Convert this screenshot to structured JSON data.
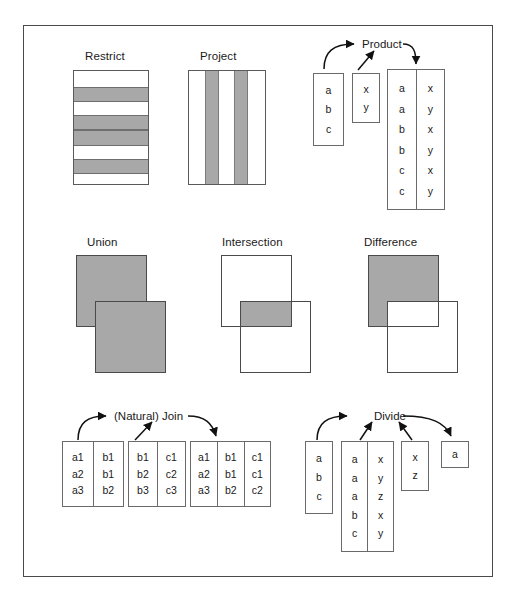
{
  "figure": {
    "title_restrict": "Restrict",
    "title_project": "Project",
    "title_product": "Product",
    "title_union": "Union",
    "title_intersection": "Intersection",
    "title_difference": "Difference",
    "title_join": "(Natural) Join",
    "title_divide": "Divide"
  },
  "colors": {
    "shade": "#a8a8a8",
    "outline": "#5a5a5a",
    "frame": "#4a4a4a",
    "text": "#1a1a1a",
    "background": "#ffffff"
  },
  "restrict": {
    "label": "Restrict",
    "description": "Rectangle with alternating horizontal shaded bands representing selected rows",
    "bands": [
      {
        "shaded": false
      },
      {
        "shaded": true
      },
      {
        "shaded": false
      },
      {
        "shaded": true
      },
      {
        "shaded": true
      },
      {
        "shaded": false
      },
      {
        "shaded": true
      },
      {
        "shaded": false
      }
    ]
  },
  "project": {
    "label": "Project",
    "description": "Rectangle with vertical shaded stripes representing selected columns",
    "stripes": [
      {
        "shaded": false
      },
      {
        "shaded": true
      },
      {
        "shaded": false
      },
      {
        "shaded": true
      },
      {
        "shaded": false
      }
    ]
  },
  "product": {
    "label": "Product",
    "operand_left": {
      "columns": [
        [
          "a",
          "b",
          "c"
        ]
      ]
    },
    "operand_right": {
      "columns": [
        [
          "x",
          "y"
        ]
      ]
    },
    "result": {
      "columns": [
        [
          "a",
          "a",
          "b",
          "b",
          "c",
          "c"
        ],
        [
          "x",
          "y",
          "x",
          "y",
          "x",
          "y"
        ]
      ]
    }
  },
  "union": {
    "label": "Union",
    "description": "Two overlapping rectangles, both entirely shaded",
    "rect_a_shaded": true,
    "rect_b_shaded": true,
    "overlap_shaded": true
  },
  "intersection": {
    "label": "Intersection",
    "description": "Two overlapping rectangles, only the overlap region shaded",
    "rect_a_shaded": false,
    "rect_b_shaded": false,
    "overlap_shaded": true
  },
  "difference": {
    "label": "Difference",
    "description": "First rectangle shaded except the overlap region, which is white",
    "rect_a_shaded": true,
    "rect_b_shaded": false,
    "overlap_shaded": false
  },
  "join": {
    "label": "(Natural) Join",
    "operand_left": {
      "columns": [
        [
          "a1",
          "a2",
          "a3"
        ],
        [
          "b1",
          "b1",
          "b2"
        ]
      ]
    },
    "operand_right": {
      "columns": [
        [
          "b1",
          "b2",
          "b3"
        ],
        [
          "c1",
          "c2",
          "c3"
        ]
      ]
    },
    "result": {
      "columns": [
        [
          "a1",
          "a2",
          "a3"
        ],
        [
          "b1",
          "b1",
          "b2"
        ],
        [
          "c1",
          "c1",
          "c2"
        ]
      ]
    }
  },
  "divide": {
    "label": "Divide",
    "operand_left": {
      "columns": [
        [
          "a",
          "b",
          "c"
        ]
      ]
    },
    "operand_middle": {
      "columns": [
        [
          "a",
          "a",
          "a",
          "b",
          "c"
        ],
        [
          "x",
          "y",
          "z",
          "x",
          "y"
        ]
      ]
    },
    "operand_right": {
      "columns": [
        [
          "x",
          "z"
        ]
      ]
    },
    "result": {
      "columns": [
        [
          "a"
        ]
      ]
    }
  }
}
